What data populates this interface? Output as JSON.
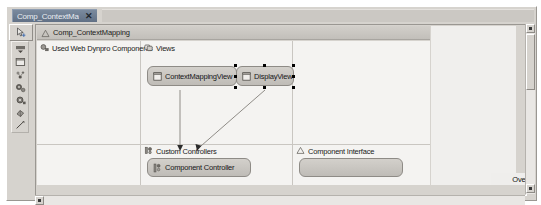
{
  "window": {
    "tab": {
      "title": "Comp_ContextMapping",
      "close_label": "✕"
    }
  },
  "editor": {
    "header": {
      "icon": "diagram-icon",
      "title": "Comp_ContextMapping"
    },
    "sections": [
      {
        "id": "used-components",
        "icon": "component-icon",
        "label": "Used Web Dynpro Components"
      },
      {
        "id": "views",
        "icon": "views-icon",
        "label": "Views"
      },
      {
        "id": "custom-controllers",
        "icon": "controller-icon",
        "label": "Custom Controllers"
      },
      {
        "id": "component-interface",
        "icon": "interface-icon",
        "label": "Component Interface"
      }
    ],
    "nodes": [
      {
        "id": "context-mapping-view",
        "label": "ContextMappingView",
        "icon": "view-icon",
        "selected": false
      },
      {
        "id": "display-view",
        "label": "DisplayView",
        "icon": "view-icon",
        "selected": true
      },
      {
        "id": "component-controller",
        "label": "Component Controller",
        "icon": "controller-node-icon",
        "selected": false
      },
      {
        "id": "interface-placeholder",
        "label": "",
        "icon": "",
        "selected": false
      }
    ],
    "connections": [
      {
        "from": "context-mapping-view",
        "to": "component-controller"
      },
      {
        "from": "display-view",
        "to": "component-controller"
      }
    ]
  },
  "palette": {
    "top_tool": {
      "name": "select-pointer-tool"
    },
    "tools": [
      {
        "name": "marquee-tool"
      },
      {
        "name": "view-shape-tool"
      },
      {
        "name": "custom-controller-tool"
      },
      {
        "name": "component-controller-tool"
      },
      {
        "name": "component-interface-tool"
      },
      {
        "name": "used-component-tool"
      },
      {
        "name": "connection-tool"
      }
    ]
  },
  "overview": {
    "label": "Overview",
    "button_icon": "expand-icon"
  },
  "scrollbars": {
    "vertical": {
      "up_arrow": "▲",
      "down_arrow": "▼"
    },
    "horizontal": {
      "left_arrow": "◀",
      "right_arrow": "▶"
    }
  },
  "colors": {
    "tab_active_bg": "#6b7b91",
    "chrome_bg": "#d6d3ce",
    "canvas_bg": "#f4f3f1",
    "node_bg": "#c9c6c1",
    "node_border": "#8e8b86",
    "selection_handle": "#000000"
  }
}
